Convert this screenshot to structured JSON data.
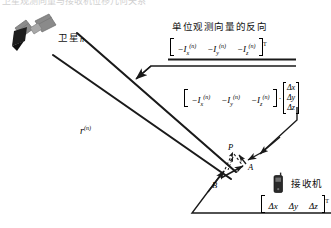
{
  "figure": {
    "type": "geometry-diagram",
    "topic": "GNSS satellite observation unit vector and receiver displacement",
    "background_color": "#ffffff",
    "line_color": "#1a1a1a",
    "clipped_top_text": "卫星观测向量与接收机位移几何关系"
  },
  "satellite": {
    "icon_name": "satellite-icon",
    "label": "卫星",
    "index": "n"
  },
  "annotation_unit_vector": {
    "caption": "单位观测向量的反向",
    "matrix": {
      "open_bracket": "[",
      "close_bracket": "]",
      "transpose": "T",
      "components": [
        "-I",
        "-I",
        "-I"
      ],
      "subscripts": [
        "x",
        "y",
        "z"
      ],
      "superscript": "(n)",
      "rendered": "[ -Ix(n)  -Iy(n)  -Iz(n) ]T"
    }
  },
  "annotation_projection": {
    "row_vector": {
      "components": [
        "-I",
        "-I",
        "-I"
      ],
      "subscripts": [
        "x",
        "y",
        "z"
      ],
      "superscript": "(n)"
    },
    "operator": "·",
    "column_vector": {
      "rows": [
        "Δx",
        "Δy",
        "Δz"
      ]
    },
    "rendered": "[ -Ix(n)  -Iy(n)  -Iz(n) ] · [Δx Δy Δz]T"
  },
  "range_label": {
    "symbol": "r",
    "superscript": "(n)"
  },
  "points": {
    "a": "A",
    "b": "B",
    "p": "P"
  },
  "receiver": {
    "icon_name": "receiver-icon",
    "label": "接收机",
    "displacement_vector": {
      "rows": [
        "Δx",
        "Δy",
        "Δz"
      ],
      "transpose": "T",
      "rendered": "[Δx  Δy  Δz]T"
    }
  }
}
